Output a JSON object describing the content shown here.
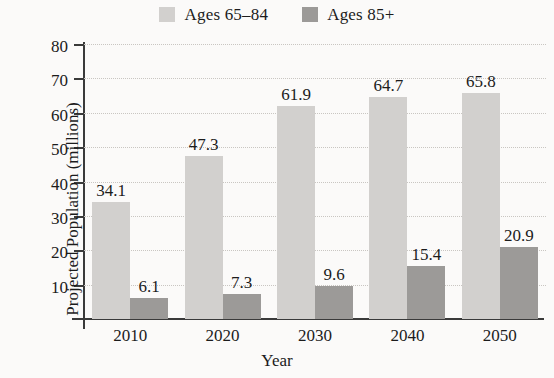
{
  "chart_data": {
    "type": "bar",
    "title": "",
    "xlabel": "Year",
    "ylabel": "Projected Population (millions)",
    "categories": [
      "2010",
      "2020",
      "2030",
      "2040",
      "2050"
    ],
    "series": [
      {
        "name": "Ages 65–84",
        "color": "#d2d0ce",
        "values": [
          34.1,
          47.3,
          61.9,
          64.7,
          65.8
        ]
      },
      {
        "name": "Ages 85+",
        "color": "#9c9a98",
        "values": [
          6.1,
          7.3,
          9.6,
          15.4,
          20.9
        ]
      }
    ],
    "ylim": [
      0,
      80
    ],
    "yticks": [
      10,
      20,
      30,
      40,
      50,
      60,
      70,
      80
    ],
    "ytick_labels": [
      "10",
      "20",
      "30",
      "40",
      "50",
      "60",
      "70",
      "80"
    ],
    "grid": "horizontal-dotted",
    "legend_position": "top-center",
    "data_labels": [
      [
        "34.1",
        "6.1"
      ],
      [
        "47.3",
        "7.3"
      ],
      [
        "61.9",
        "9.6"
      ],
      [
        "64.7",
        "15.4"
      ],
      [
        "65.8",
        "20.9"
      ]
    ],
    "axis_color": "#3a3a3a",
    "gridline_color": "#c9c6c2",
    "background_color": "#fbfaf9"
  }
}
